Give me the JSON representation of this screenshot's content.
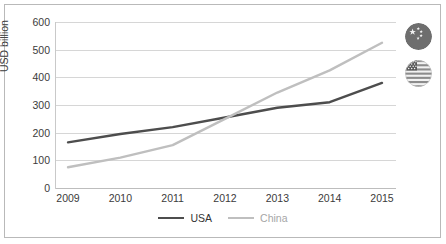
{
  "chart_data": {
    "type": "line",
    "title": "",
    "xlabel": "",
    "ylabel": "USD billion",
    "categories": [
      "2009",
      "2010",
      "2011",
      "2012",
      "2013",
      "2014",
      "2015"
    ],
    "x": [
      2009,
      2010,
      2011,
      2012,
      2013,
      2014,
      2015
    ],
    "ylim": [
      0,
      600
    ],
    "ytick_values": [
      0,
      100,
      200,
      300,
      400,
      500,
      600
    ],
    "ytick_labels": [
      "0",
      "100",
      "200",
      "300",
      "400",
      "500",
      "600"
    ],
    "grid": true,
    "legend_position": "bottom",
    "series": [
      {
        "name": "USA",
        "color": "#4d4d4d",
        "values": [
          165,
          195,
          220,
          255,
          290,
          310,
          380
        ]
      },
      {
        "name": "China",
        "color": "#bfbfbf",
        "values": [
          75,
          110,
          155,
          250,
          345,
          425,
          525
        ]
      }
    ]
  },
  "legend": {
    "items": [
      {
        "label": "USA",
        "color": "#4d4d4d",
        "text_color": "#333333"
      },
      {
        "label": "China",
        "color": "#bfbfbf",
        "text_color": "#a6a6a6"
      }
    ]
  },
  "badges": [
    {
      "name": "china-flag-badge",
      "country": "China",
      "icon": "flag-china-icon"
    },
    {
      "name": "usa-flag-badge",
      "country": "USA",
      "icon": "flag-usa-icon"
    }
  ],
  "colors": {
    "usa_line": "#4d4d4d",
    "china_line": "#bfbfbf",
    "gridline": "#d6d6d6",
    "border": "#b9b9b9",
    "text": "#3b3b3b",
    "background": "#ffffff"
  }
}
